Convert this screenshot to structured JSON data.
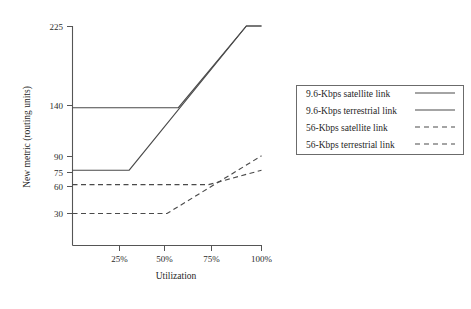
{
  "chart_data": {
    "type": "line",
    "title": "",
    "xlabel": "Utilization",
    "ylabel": "New metric (routing units)",
    "xlim": [
      0,
      110
    ],
    "ylim": [
      0,
      240
    ],
    "x_tick_labels": [
      "25%",
      "50%",
      "75%",
      "100%"
    ],
    "x_tick_values": [
      25,
      50,
      75,
      100
    ],
    "y_tick_labels": [
      "225",
      "140",
      "90",
      "75",
      "60",
      "30"
    ],
    "y_tick_values": [
      225,
      140,
      90,
      75,
      60,
      30
    ],
    "grid": false,
    "legend_position": "right",
    "series": [
      {
        "name": "9.6-Kbps satellite link",
        "style": "solid",
        "x": [
          0,
          56,
          92,
          100
        ],
        "y": [
          140,
          140,
          225,
          225
        ]
      },
      {
        "name": "9.6-Kbps terrestrial link",
        "style": "solid",
        "x": [
          0,
          30,
          92,
          100
        ],
        "y": [
          75,
          75,
          225,
          225
        ]
      },
      {
        "name": "56-Kbps satellite link",
        "style": "dashed",
        "x": [
          0,
          72,
          100
        ],
        "y": [
          60,
          60,
          75
        ]
      },
      {
        "name": "56-Kbps terrestrial link",
        "style": "dashed",
        "x": [
          0,
          50,
          100
        ],
        "y": [
          30,
          30,
          90
        ]
      }
    ]
  },
  "axes": {
    "y_title": "New metric (routing units)",
    "x_title": "Utilization",
    "y_ticks": [
      {
        "label": "225"
      },
      {
        "label": "140"
      },
      {
        "label": "90"
      },
      {
        "label": "75"
      },
      {
        "label": "60"
      },
      {
        "label": "30"
      }
    ],
    "x_ticks": [
      {
        "label": "25%"
      },
      {
        "label": "50%"
      },
      {
        "label": "75%"
      },
      {
        "label": "100%"
      }
    ]
  },
  "legend": {
    "entries": [
      {
        "label": "9.6-Kbps satellite link",
        "style": "solid"
      },
      {
        "label": "9.6-Kbps terrestrial link",
        "style": "solid"
      },
      {
        "label": "56-Kbps satellite link",
        "style": "dashed"
      },
      {
        "label": "56-Kbps terrestrial link",
        "style": "dashed"
      }
    ]
  },
  "colors": {
    "line": "#4a4a4a",
    "axis": "#555555",
    "legend_border": "#6b6b6b",
    "background": "#ffffff",
    "text": "#1f1f1f"
  }
}
